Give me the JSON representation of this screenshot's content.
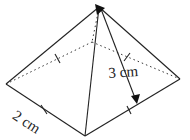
{
  "figure": {
    "type": "square-based pyramid",
    "labels": {
      "slant_height": "3 cm",
      "base_edge": "2 cm"
    },
    "colors": {
      "line": "#222222",
      "background": "#ffffff"
    }
  }
}
